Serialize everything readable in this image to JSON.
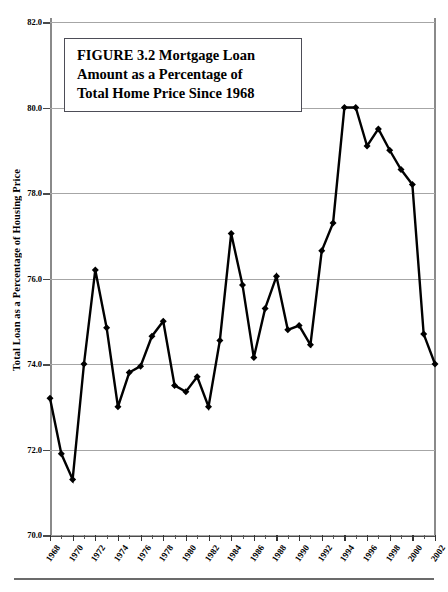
{
  "figure": {
    "title_lines": [
      "FIGURE 3.2  Mortgage Loan",
      "Amount as a Percentage of",
      "Total Home Price Since 1968"
    ],
    "title_full": "FIGURE 3.2  Mortgage Loan Amount as a Percentage of Total Home Price Since 1968"
  },
  "chart_data": {
    "type": "line",
    "title": "FIGURE 3.2  Mortgage Loan Amount as a Percentage of Total Home Price Since 1968",
    "xlabel": "",
    "ylabel": "Total Loan as a Percentage of Housing Price",
    "ylim": [
      70.0,
      82.0
    ],
    "xlim": [
      1968,
      2002
    ],
    "ytick_labels": [
      "82.0",
      "80.0",
      "78.0",
      "76.0",
      "74.0",
      "72.0",
      "70.0"
    ],
    "ytick_values": [
      82.0,
      80.0,
      78.0,
      76.0,
      74.0,
      72.0,
      70.0
    ],
    "xtick_labels": [
      "1968",
      "1970",
      "1972",
      "1974",
      "1976",
      "1978",
      "1980",
      "1982",
      "1984",
      "1986",
      "1988",
      "1990",
      "1992",
      "1994",
      "1996",
      "1998",
      "2000",
      "2002"
    ],
    "xtick_values": [
      1968,
      1970,
      1972,
      1974,
      1976,
      1978,
      1980,
      1982,
      1984,
      1986,
      1988,
      1990,
      1992,
      1994,
      1996,
      1998,
      2000,
      2002
    ],
    "x_minor_tick_interval": 1,
    "grid": true,
    "grid_axis": "y",
    "legend": false,
    "marker": "diamond",
    "line_color": "#000000",
    "marker_color": "#000000",
    "x": [
      1968,
      1969,
      1970,
      1971,
      1972,
      1973,
      1974,
      1975,
      1976,
      1977,
      1978,
      1979,
      1980,
      1981,
      1982,
      1983,
      1984,
      1985,
      1986,
      1987,
      1988,
      1989,
      1990,
      1991,
      1992,
      1993,
      1994,
      1995,
      1996,
      1997,
      1998,
      1999,
      2000,
      2001,
      2002
    ],
    "values": [
      73.2,
      71.9,
      71.3,
      74.0,
      76.2,
      74.85,
      73.0,
      73.8,
      73.95,
      74.65,
      75.0,
      73.5,
      73.35,
      73.7,
      73.0,
      74.55,
      77.05,
      75.85,
      74.15,
      75.3,
      76.05,
      74.8,
      74.9,
      74.45,
      76.65,
      77.3,
      80.0,
      80.0,
      79.1,
      79.5,
      79.0,
      78.55,
      78.2,
      74.7,
      74.0
    ],
    "series": [
      {
        "name": "Total Loan as a Percentage of Housing Price",
        "values": [
          73.2,
          71.9,
          71.3,
          74.0,
          76.2,
          74.85,
          73.0,
          73.8,
          73.95,
          74.65,
          75.0,
          73.5,
          73.35,
          73.7,
          73.0,
          74.55,
          77.05,
          75.85,
          74.15,
          75.3,
          76.05,
          74.8,
          74.9,
          74.45,
          76.65,
          77.3,
          80.0,
          80.0,
          79.1,
          79.5,
          79.0,
          78.55,
          78.2,
          74.7,
          74.0
        ]
      }
    ]
  }
}
